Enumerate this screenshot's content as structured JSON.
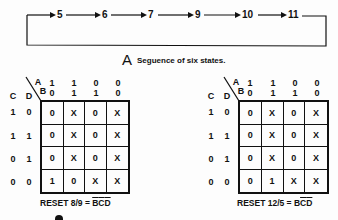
{
  "sequence": {
    "states": [
      "5",
      "6",
      "7",
      "9",
      "10",
      "11"
    ],
    "caption_letter": "A",
    "caption_text": "Seguence of six states."
  },
  "kmap_left": {
    "corner_top": "A",
    "corner_bottom": "B",
    "row_header_labels": [
      "C",
      "D"
    ],
    "col_headers_A": [
      "1",
      "1",
      "0",
      "0"
    ],
    "col_headers_B": [
      "0",
      "1",
      "1",
      "0"
    ],
    "rows": [
      {
        "C": "1",
        "D": "0",
        "cells": [
          "0",
          "X",
          "0",
          "X"
        ]
      },
      {
        "C": "1",
        "D": "1",
        "cells": [
          "0",
          "X",
          "0",
          "X"
        ]
      },
      {
        "C": "0",
        "D": "1",
        "cells": [
          "0",
          "X",
          "0",
          "X"
        ]
      },
      {
        "C": "0",
        "D": "0",
        "cells": [
          "1",
          "0",
          "X",
          "X"
        ]
      }
    ],
    "formula_prefix": "RESET 8/9 = ",
    "formula_terms": [
      "B",
      "C",
      "D"
    ],
    "formula_overlines": [
      true,
      true,
      true
    ]
  },
  "kmap_right": {
    "corner_top": "A",
    "corner_bottom": "B",
    "row_header_labels": [
      "C",
      "D"
    ],
    "col_headers_A": [
      "1",
      "1",
      "0",
      "0"
    ],
    "col_headers_B": [
      "0",
      "1",
      "1",
      "0"
    ],
    "rows": [
      {
        "C": "1",
        "D": "0",
        "cells": [
          "0",
          "X",
          "0",
          "X"
        ]
      },
      {
        "C": "1",
        "D": "1",
        "cells": [
          "0",
          "X",
          "0",
          "X"
        ]
      },
      {
        "C": "0",
        "D": "1",
        "cells": [
          "0",
          "X",
          "0",
          "X"
        ]
      },
      {
        "C": "0",
        "D": "0",
        "cells": [
          "0",
          "1",
          "X",
          "X"
        ]
      }
    ],
    "formula_prefix": "RESET 12/5 = ",
    "formula_terms": [
      "B",
      "C",
      "D"
    ],
    "formula_overlines": [
      false,
      true,
      true
    ]
  }
}
